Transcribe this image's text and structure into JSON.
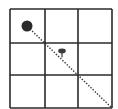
{
  "diagram": {
    "type": "grid-path",
    "grid": {
      "rows": 3,
      "cols": 3,
      "x_lines": [
        10,
        45,
        78,
        112
      ],
      "y_lines": [
        9,
        43,
        75,
        108
      ],
      "line_color": "#2a2a2a",
      "line_width": 1.6
    },
    "path": {
      "style": "dotted",
      "color": "#333333",
      "from": [
        30,
        29
      ],
      "to": [
        112,
        108
      ]
    },
    "markers": [
      {
        "name": "large-dot",
        "shape": "circle",
        "cx": 27,
        "cy": 26,
        "r": 5.5,
        "color": "#2b2b2b"
      },
      {
        "name": "small-marker",
        "shape": "mushroom",
        "cx": 62,
        "cy": 51,
        "rx": 3.8,
        "ry": 2.4,
        "stem_len": 4,
        "color": "#3a3a3a"
      }
    ]
  }
}
